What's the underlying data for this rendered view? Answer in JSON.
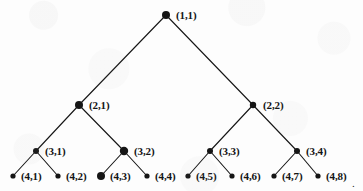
{
  "figure": {
    "kind": "binary-tree-diagram",
    "width": 363,
    "height": 191,
    "background_color": "#fdfdfd",
    "ink_color": "#151515",
    "trailing_mark": "."
  },
  "tree": {
    "depth": 4,
    "root_id": "1-1",
    "nodes": [
      {
        "id": "1-1",
        "label": "(1,1)",
        "level": 1,
        "index": 1,
        "x": 166,
        "y": 15,
        "r": 4.0,
        "label_x": 176,
        "label_y": 10
      },
      {
        "id": "2-1",
        "label": "(2,1)",
        "level": 2,
        "index": 1,
        "x": 79,
        "y": 105,
        "r": 4.0,
        "label_x": 89,
        "label_y": 100
      },
      {
        "id": "2-2",
        "label": "(2,2)",
        "level": 2,
        "index": 2,
        "x": 253,
        "y": 105,
        "r": 3.2,
        "label_x": 263,
        "label_y": 100
      },
      {
        "id": "3-1",
        "label": "(3,1)",
        "level": 3,
        "index": 1,
        "x": 36,
        "y": 151,
        "r": 3.0,
        "label_x": 45,
        "label_y": 146
      },
      {
        "id": "3-2",
        "label": "(3,2)",
        "level": 3,
        "index": 2,
        "x": 124,
        "y": 151,
        "r": 4.2,
        "label_x": 134,
        "label_y": 146
      },
      {
        "id": "3-3",
        "label": "(3,3)",
        "level": 3,
        "index": 3,
        "x": 210,
        "y": 151,
        "r": 3.0,
        "label_x": 219,
        "label_y": 146
      },
      {
        "id": "3-4",
        "label": "(3,4)",
        "level": 3,
        "index": 4,
        "x": 297,
        "y": 151,
        "r": 3.0,
        "label_x": 306,
        "label_y": 146
      },
      {
        "id": "4-1",
        "label": "(4,1)",
        "level": 4,
        "index": 1,
        "x": 13,
        "y": 176,
        "r": 2.6,
        "label_x": 21,
        "label_y": 171
      },
      {
        "id": "4-2",
        "label": "(4,2)",
        "level": 4,
        "index": 2,
        "x": 58,
        "y": 176,
        "r": 2.6,
        "label_x": 66,
        "label_y": 171
      },
      {
        "id": "4-3",
        "label": "(4,3)",
        "level": 4,
        "index": 3,
        "x": 101,
        "y": 176,
        "r": 4.0,
        "label_x": 110,
        "label_y": 171
      },
      {
        "id": "4-4",
        "label": "(4,4)",
        "level": 4,
        "index": 4,
        "x": 147,
        "y": 176,
        "r": 2.6,
        "label_x": 155,
        "label_y": 171
      },
      {
        "id": "4-5",
        "label": "(4,5)",
        "level": 4,
        "index": 5,
        "x": 188,
        "y": 176,
        "r": 2.6,
        "label_x": 196,
        "label_y": 171
      },
      {
        "id": "4-6",
        "label": "(4,6)",
        "level": 4,
        "index": 6,
        "x": 232,
        "y": 176,
        "r": 2.6,
        "label_x": 240,
        "label_y": 171
      },
      {
        "id": "4-7",
        "label": "(4,7)",
        "level": 4,
        "index": 7,
        "x": 274,
        "y": 176,
        "r": 2.6,
        "label_x": 282,
        "label_y": 171
      },
      {
        "id": "4-8",
        "label": "(4,8)",
        "level": 4,
        "index": 8,
        "x": 318,
        "y": 176,
        "r": 2.6,
        "label_x": 326,
        "label_y": 171
      }
    ],
    "edges": [
      {
        "from": "1-1",
        "to": "2-1"
      },
      {
        "from": "1-1",
        "to": "2-2"
      },
      {
        "from": "2-1",
        "to": "3-1"
      },
      {
        "from": "2-1",
        "to": "3-2"
      },
      {
        "from": "2-2",
        "to": "3-3"
      },
      {
        "from": "2-2",
        "to": "3-4"
      },
      {
        "from": "3-1",
        "to": "4-1"
      },
      {
        "from": "3-1",
        "to": "4-2"
      },
      {
        "from": "3-2",
        "to": "4-3"
      },
      {
        "from": "3-2",
        "to": "4-4"
      },
      {
        "from": "3-3",
        "to": "4-5"
      },
      {
        "from": "3-3",
        "to": "4-6"
      },
      {
        "from": "3-4",
        "to": "4-7"
      },
      {
        "from": "3-4",
        "to": "4-8"
      }
    ]
  }
}
